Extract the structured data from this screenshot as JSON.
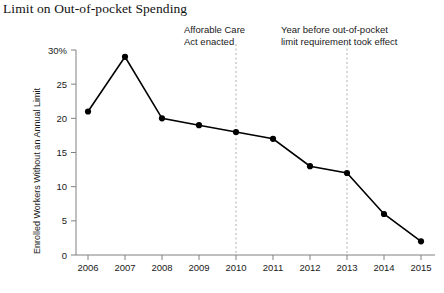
{
  "figure": {
    "title": "Limit on Out-of-pocket Spending",
    "background_color": "#ffffff",
    "line_color": "#000000",
    "marker_color": "#000000",
    "axis_color": "#808080",
    "annotation_line_color": "#b0b0b0"
  },
  "annotations": [
    {
      "id": "aca",
      "line1": "Afforable Care",
      "line2": "Act enacted",
      "at_year": "2010"
    },
    {
      "id": "limit",
      "line1": "Year before out-of-pocket",
      "line2": "limit requirement took effect",
      "at_year": "2013"
    }
  ],
  "chart_data": {
    "type": "line",
    "title": "Limit on Out-of-pocket Spending",
    "xlabel": "",
    "ylabel": "Enrolled Workers Without an Annual Limit",
    "categories": [
      "2006",
      "2007",
      "2008",
      "2009",
      "2010",
      "2011",
      "2012",
      "2013",
      "2014",
      "2015"
    ],
    "x": [
      2006,
      2007,
      2008,
      2009,
      2010,
      2011,
      2012,
      2013,
      2014,
      2015
    ],
    "values": [
      21,
      29,
      20,
      19,
      18,
      17,
      13,
      12,
      6,
      2
    ],
    "ylim": [
      0,
      30
    ],
    "yticks": [
      0,
      5,
      10,
      15,
      20,
      25,
      30
    ],
    "ytick_labels": [
      "0",
      "5",
      "10",
      "15",
      "20",
      "25",
      "30%"
    ],
    "grid": false,
    "legend": null,
    "markers": true,
    "annotation_lines": [
      {
        "x": 2010,
        "style": "dashed",
        "label": "Afforable Care Act enacted"
      },
      {
        "x": 2013,
        "style": "dashed",
        "label": "Year before out-of-pocket limit requirement took effect"
      }
    ]
  }
}
